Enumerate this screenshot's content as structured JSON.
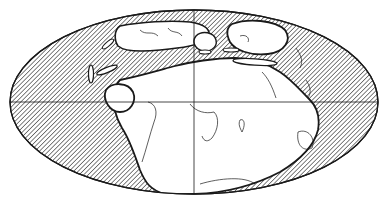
{
  "map": {
    "type": "paleogeographic-world-map",
    "projection": "equal-area elliptical (Mollweide-like)",
    "colors": {
      "background": "#ffffff",
      "ink": "#1a1a1a",
      "land": "#ffffff"
    },
    "features": {
      "ocean": "diagonal hatching",
      "continents": "white supercontinent landmass with modern coastline outlines",
      "graticule": [
        "equator",
        "central meridian"
      ]
    }
  }
}
